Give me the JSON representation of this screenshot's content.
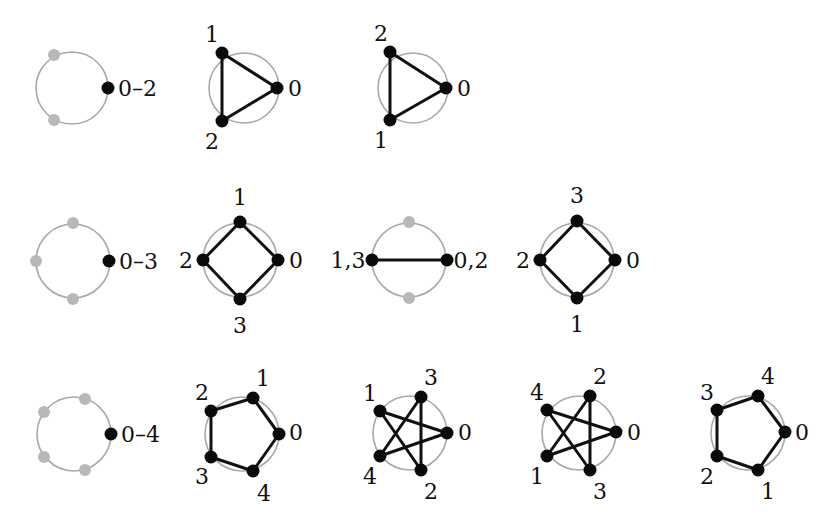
{
  "colors": {
    "ring": "#a8a8a8",
    "edge": "#111111",
    "node": "#0a0a0a",
    "ghost_node": "#b8b8b8"
  },
  "rows": [
    {
      "n": 3,
      "base": {
        "cx": 72,
        "cy": 88,
        "r": 36,
        "label": "0–2",
        "ghosts": [
          [
            54,
            55
          ],
          [
            54,
            120
          ]
        ],
        "node": [
          108,
          88
        ],
        "label_pos": [
          118,
          88
        ]
      },
      "panels": [
        {
          "cx": 244,
          "cy": 88,
          "r": 35,
          "nodes": [
            {
              "id": "0",
              "x": 277,
              "y": 88,
              "lx": 295,
              "ly": 88
            },
            {
              "id": "1",
              "x": 222,
              "y": 53,
              "lx": 212,
              "ly": 34
            },
            {
              "id": "2",
              "x": 222,
              "y": 121,
              "lx": 212,
              "ly": 141
            }
          ],
          "edges": [
            [
              0,
              1
            ],
            [
              1,
              2
            ],
            [
              2,
              0
            ]
          ]
        },
        {
          "cx": 413,
          "cy": 88,
          "r": 35,
          "nodes": [
            {
              "id": "0",
              "x": 446,
              "y": 88,
              "lx": 464,
              "ly": 88
            },
            {
              "id": "2",
              "x": 390,
              "y": 52,
              "lx": 381,
              "ly": 33
            },
            {
              "id": "1",
              "x": 390,
              "y": 120,
              "lx": 381,
              "ly": 140
            }
          ],
          "edges": [
            [
              0,
              1
            ],
            [
              1,
              2
            ],
            [
              2,
              0
            ]
          ]
        }
      ]
    },
    {
      "n": 4,
      "base": {
        "cx": 73,
        "cy": 261,
        "r": 37,
        "label": "0–3",
        "ghosts": [
          [
            73,
            223
          ],
          [
            36,
            261
          ],
          [
            73,
            299
          ]
        ],
        "node": [
          109,
          261
        ],
        "label_pos": [
          119,
          261
        ]
      },
      "panels": [
        {
          "cx": 240,
          "cy": 260,
          "r": 37,
          "nodes": [
            {
              "id": "0",
              "x": 278,
              "y": 260,
              "lx": 296,
              "ly": 260
            },
            {
              "id": "1",
              "x": 240,
              "y": 222,
              "lx": 240,
              "ly": 197
            },
            {
              "id": "2",
              "x": 203,
              "y": 260,
              "lx": 186,
              "ly": 260
            },
            {
              "id": "3",
              "x": 240,
              "y": 299,
              "lx": 240,
              "ly": 325
            }
          ],
          "edges": [
            [
              0,
              1
            ],
            [
              1,
              2
            ],
            [
              2,
              3
            ],
            [
              3,
              0
            ]
          ]
        },
        {
          "cx": 409,
          "cy": 260,
          "r": 37,
          "ghosts": [
            [
              409,
              222
            ],
            [
              409,
              298
            ]
          ],
          "nodes": [
            {
              "id": "0,2",
              "x": 447,
              "y": 260,
              "lx": 471,
              "ly": 260
            },
            {
              "id": "1,3",
              "x": 372,
              "y": 260,
              "lx": 348,
              "ly": 260
            }
          ],
          "edges": [
            [
              0,
              1
            ]
          ]
        },
        {
          "cx": 577,
          "cy": 260,
          "r": 37,
          "nodes": [
            {
              "id": "0",
              "x": 615,
              "y": 260,
              "lx": 633,
              "ly": 260
            },
            {
              "id": "3",
              "x": 577,
              "y": 221,
              "lx": 577,
              "ly": 195
            },
            {
              "id": "2",
              "x": 540,
              "y": 260,
              "lx": 523,
              "ly": 260
            },
            {
              "id": "1",
              "x": 577,
              "y": 298,
              "lx": 577,
              "ly": 324
            }
          ],
          "edges": [
            [
              0,
              1
            ],
            [
              1,
              2
            ],
            [
              2,
              3
            ],
            [
              3,
              0
            ]
          ]
        }
      ]
    },
    {
      "n": 5,
      "base": {
        "cx": 74,
        "cy": 434,
        "r": 37,
        "label": "0–4",
        "ghosts": [
          [
            85,
            399
          ],
          [
            44,
            412
          ],
          [
            44,
            457
          ],
          [
            85,
            470
          ]
        ],
        "node": [
          111,
          434
        ],
        "label_pos": [
          121,
          434
        ]
      },
      "panels": [
        {
          "cx": 242,
          "cy": 434,
          "r": 37,
          "nodes": [
            {
              "id": "0",
              "x": 279,
              "y": 434,
              "lx": 296,
              "ly": 432
            },
            {
              "id": "1",
              "x": 253,
              "y": 398,
              "lx": 263,
              "ly": 378
            },
            {
              "id": "2",
              "x": 211,
              "y": 411,
              "lx": 202,
              "ly": 392
            },
            {
              "id": "3",
              "x": 211,
              "y": 457,
              "lx": 202,
              "ly": 476
            },
            {
              "id": "4",
              "x": 253,
              "y": 471,
              "lx": 264,
              "ly": 493
            }
          ],
          "edges": [
            [
              0,
              1
            ],
            [
              1,
              2
            ],
            [
              2,
              3
            ],
            [
              3,
              4
            ],
            [
              4,
              0
            ]
          ]
        },
        {
          "cx": 410,
          "cy": 433,
          "r": 37,
          "nodes": [
            {
              "id": "0",
              "x": 447,
              "y": 433,
              "lx": 465,
              "ly": 432
            },
            {
              "id": "3",
              "x": 421,
              "y": 397,
              "lx": 431,
              "ly": 377
            },
            {
              "id": "1",
              "x": 380,
              "y": 411,
              "lx": 370,
              "ly": 393
            },
            {
              "id": "4",
              "x": 380,
              "y": 456,
              "lx": 370,
              "ly": 476
            },
            {
              "id": "2",
              "x": 421,
              "y": 470,
              "lx": 431,
              "ly": 491
            }
          ],
          "edges": [
            [
              0,
              2
            ],
            [
              2,
              1
            ],
            [
              1,
              0
            ],
            [
              0,
              4
            ],
            [
              4,
              3
            ],
            [
              3,
              2
            ],
            [
              1,
              3
            ],
            [
              4,
              0
            ]
          ],
          "star": true
        },
        {
          "cx": 579,
          "cy": 433,
          "r": 37,
          "nodes": [
            {
              "id": "0",
              "x": 616,
              "y": 432,
              "lx": 634,
              "ly": 432
            },
            {
              "id": "2",
              "x": 590,
              "y": 396,
              "lx": 600,
              "ly": 376
            },
            {
              "id": "4",
              "x": 547,
              "y": 410,
              "lx": 537,
              "ly": 392
            },
            {
              "id": "1",
              "x": 547,
              "y": 456,
              "lx": 537,
              "ly": 476
            },
            {
              "id": "3",
              "x": 590,
              "y": 470,
              "lx": 600,
              "ly": 491
            }
          ],
          "star": true
        },
        {
          "cx": 748,
          "cy": 433,
          "r": 37,
          "nodes": [
            {
              "id": "0",
              "x": 785,
              "y": 432,
              "lx": 802,
              "ly": 432
            },
            {
              "id": "4",
              "x": 758,
              "y": 396,
              "lx": 768,
              "ly": 376
            },
            {
              "id": "3",
              "x": 717,
              "y": 410,
              "lx": 707,
              "ly": 392
            },
            {
              "id": "2",
              "x": 717,
              "y": 456,
              "lx": 707,
              "ly": 476
            },
            {
              "id": "1",
              "x": 758,
              "y": 470,
              "lx": 768,
              "ly": 491
            }
          ],
          "edges": [
            [
              0,
              1
            ],
            [
              1,
              2
            ],
            [
              2,
              3
            ],
            [
              3,
              4
            ],
            [
              4,
              0
            ]
          ]
        }
      ]
    }
  ]
}
